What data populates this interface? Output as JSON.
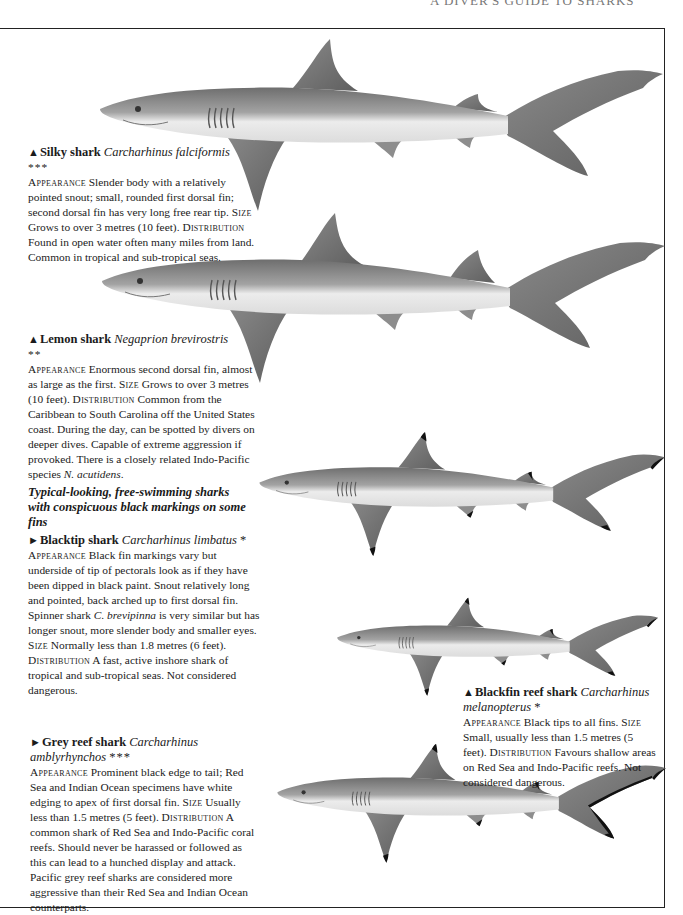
{
  "running_head": "A DIVER'S GUIDE TO SHARKS",
  "section_heading": "Typical-looking, free-swimming sharks with conspicuous black markings on some fins",
  "labels": {
    "appearance": "Appearance",
    "size": "Size",
    "distribution": "Distribution"
  },
  "entries": [
    {
      "marker": "▲",
      "common_name": "Silky shark",
      "latin_name": "Carcharhinus falciformis",
      "rating": "***",
      "appearance": "Slender body with a relatively pointed snout; small, rounded first dorsal fin; second dorsal fin has very long free rear tip.",
      "size": "Grows to over 3 metres (10 feet).",
      "distribution": "Found in open water often many miles from land. Common in tropical and sub-tropical seas."
    },
    {
      "marker": "▲",
      "common_name": "Lemon shark",
      "latin_name": "Negaprion brevirostris",
      "rating": "**",
      "appearance": "Enormous second dorsal fin, almost as large as the first.",
      "size": "Grows to over 3 metres (10 feet).",
      "distribution": "Common from the Caribbean to South Carolina off the United States coast. During the day, can be spotted by divers on deeper dives. Capable of extreme aggression if provoked. There is a closely related Indo-Pacific species",
      "distribution_latin": "N. acutidens",
      "distribution_end": "."
    },
    {
      "marker": "►",
      "common_name": "Blacktip shark",
      "latin_name": "Carcharhinus limbatus",
      "rating": "*",
      "appearance": "Black fin markings vary but underside of tip of pectorals look as if they have been dipped in black paint. Snout relatively long and pointed, back arched up to first dorsal fin. Spinner shark",
      "appearance_latin": "C. brevipinna",
      "appearance_end": "is very similar but has longer snout, more slender body and smaller eyes.",
      "size": "Normally less than 1.8 metres (6 feet).",
      "distribution": "A fast, active inshore shark of tropical and sub-tropical seas. Not considered dangerous."
    },
    {
      "marker": "▲",
      "common_name": "Blackfin reef shark",
      "latin_name": "Carcharhinus melanopterus",
      "rating": "*",
      "appearance": "Black tips to all fins.",
      "size": "Small, usually less than 1.5 metres (5 feet).",
      "distribution": "Favours shallow areas on Red Sea and Indo-Pacific reefs. Not considered dangerous."
    },
    {
      "marker": "►",
      "common_name": "Grey reef shark",
      "latin_name": "Carcharhinus amblyrhynchos",
      "rating": "***",
      "appearance": "Prominent black edge to tail; Red Sea and Indian Ocean specimens have white edging to apex of first dorsal fin.",
      "size": "Usually less than 1.5 metres (5 feet).",
      "distribution": "A common shark of Red Sea and Indo-Pacific coral reefs. Should never be harassed or followed as this can lead to a hunched display and attack. Pacific grey reef sharks are considered more aggressive than their Red Sea and Indian Ocean counterparts."
    }
  ],
  "illustrations": [
    {
      "subject": "Silky shark",
      "fin_tips": "plain"
    },
    {
      "subject": "Lemon shark",
      "fin_tips": "plain"
    },
    {
      "subject": "Blacktip shark",
      "fin_tips": "black"
    },
    {
      "subject": "Blackfin reef shark",
      "fin_tips": "black"
    },
    {
      "subject": "Grey reef shark",
      "fin_tips": "black-tail-edge"
    }
  ],
  "colors": {
    "shark_dark": "#6e6e6e",
    "shark_mid": "#a3a3a3",
    "shark_belly": "#ececec",
    "fin_black": "#111111",
    "frame": "#222222"
  }
}
